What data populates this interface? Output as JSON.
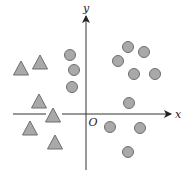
{
  "diagram": {
    "type": "scatter-classification",
    "width": 187,
    "height": 178,
    "colors": {
      "background": "#ffffff",
      "axis": "#333333",
      "marker_fill": "#a9a9a9",
      "marker_stroke": "#6e6e6e"
    },
    "axes": {
      "origin": [
        86,
        114
      ],
      "x_axis": {
        "label": "x",
        "from": 13,
        "to": 171,
        "gap": [
          46,
          62
        ],
        "label_pos": [
          178,
          118
        ]
      },
      "y_axis": {
        "label": "y",
        "from": 170,
        "to": 16,
        "label_pos": [
          86,
          12
        ]
      },
      "origin_label": {
        "text": "O",
        "pos": [
          93,
          126
        ]
      }
    },
    "triangles": [
      {
        "cx": 21,
        "cy": 68
      },
      {
        "cx": 40,
        "cy": 62
      },
      {
        "cx": 39,
        "cy": 101
      },
      {
        "cx": 53,
        "cy": 115
      },
      {
        "cx": 30,
        "cy": 128
      },
      {
        "cx": 55,
        "cy": 142
      }
    ],
    "circles": [
      {
        "cx": 70,
        "cy": 55
      },
      {
        "cx": 74,
        "cy": 70
      },
      {
        "cx": 72,
        "cy": 87
      },
      {
        "cx": 128,
        "cy": 47
      },
      {
        "cx": 144,
        "cy": 52
      },
      {
        "cx": 118,
        "cy": 61
      },
      {
        "cx": 134,
        "cy": 74
      },
      {
        "cx": 155,
        "cy": 74
      },
      {
        "cx": 129,
        "cy": 103
      },
      {
        "cx": 110,
        "cy": 127
      },
      {
        "cx": 140,
        "cy": 128
      },
      {
        "cx": 128,
        "cy": 152
      }
    ],
    "marker_sizes": {
      "circle_radius": 5.5,
      "triangle_half_width": 7.5,
      "triangle_height": 14
    }
  }
}
